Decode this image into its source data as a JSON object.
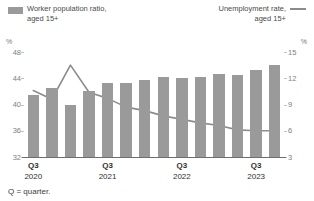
{
  "legend": {
    "bars": {
      "line1": "Worker population ratio,",
      "line2": "aged 15+",
      "swatch_icon": "bar-swatch",
      "color": "#9a9a9a"
    },
    "line": {
      "line1": "Unemployment rate,",
      "line2": "aged 15+",
      "line_icon": "line-swatch",
      "color": "#8c8c8c"
    }
  },
  "axes": {
    "left_unit": "%",
    "right_unit": "%",
    "left_ticks": [
      "48",
      "44",
      "40",
      "36",
      "32"
    ],
    "right_ticks": [
      "15",
      "12",
      "9",
      "6",
      "3"
    ]
  },
  "footnote": "Q = quarter.",
  "xlabels": [
    {
      "q": "Q3",
      "yr": "2020"
    },
    {
      "q": "Q3",
      "yr": "2021"
    },
    {
      "q": "Q3",
      "yr": "2022"
    },
    {
      "q": "Q3",
      "yr": "2023"
    }
  ],
  "chart_data": {
    "type": "bar",
    "title": "",
    "xlabel": "",
    "ylabel": "%",
    "grid": false,
    "legend_position": "top",
    "categories": [
      "Q3 2020",
      "Q4 2020",
      "Q1 2021",
      "Q2 2021",
      "Q3 2021",
      "Q4 2021",
      "Q1 2022",
      "Q2 2022",
      "Q3 2022",
      "Q4 2022",
      "Q1 2023",
      "Q2 2023",
      "Q3 2023",
      "Q4 2023"
    ],
    "series": [
      {
        "name": "Worker population ratio, aged 15+",
        "type": "bar",
        "axis": "left",
        "unit": "%",
        "color": "#9a9a9a",
        "ylim": [
          32,
          48
        ],
        "values": [
          41.5,
          42.5,
          40.0,
          42.0,
          43.3,
          43.3,
          43.7,
          44.2,
          44.0,
          44.2,
          44.7,
          44.5,
          45.2,
          46.0
        ]
      },
      {
        "name": "Unemployment rate, aged 15+",
        "type": "line",
        "axis": "right",
        "unit": "%",
        "color": "#8c8c8c",
        "ylim": [
          3,
          15
        ],
        "values": [
          10.6,
          9.6,
          13.5,
          10.4,
          9.7,
          8.7,
          8.3,
          7.7,
          7.3,
          6.9,
          6.6,
          6.1,
          6.0,
          6.0
        ]
      }
    ]
  }
}
